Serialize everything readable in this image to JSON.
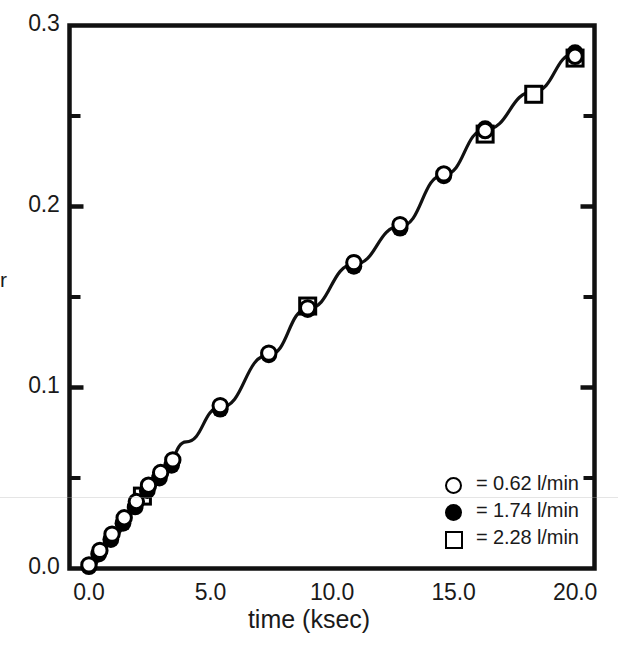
{
  "chart_data": {
    "type": "scatter",
    "title": "",
    "xlabel": "time (ksec)",
    "ylabel": "",
    "xlim": [
      -0.8,
      20.8
    ],
    "ylim": [
      0.0,
      0.3
    ],
    "xticks": [
      0.0,
      5.0,
      10.0,
      15.0,
      20.0
    ],
    "xtick_labels": [
      "0.0",
      "5.0",
      "10.0",
      "15.0",
      "20.0"
    ],
    "yticks": [
      0.0,
      0.1,
      0.2,
      0.3
    ],
    "ytick_labels": [
      "0.0",
      "0.1",
      "0.2",
      "0.3"
    ],
    "yminorticks": [
      0.05,
      0.15,
      0.25
    ],
    "grid": false,
    "legend_position": "lower-right",
    "series": [
      {
        "name": "0.62 l/min",
        "label": "= 0.62 l/min",
        "marker": "open-circle",
        "color": "#000000",
        "points": [
          [
            0.0,
            0.002
          ],
          [
            0.45,
            0.01
          ],
          [
            0.95,
            0.019
          ],
          [
            1.45,
            0.028
          ],
          [
            1.95,
            0.037
          ],
          [
            2.45,
            0.046
          ],
          [
            2.95,
            0.053
          ],
          [
            3.45,
            0.06
          ],
          [
            5.4,
            0.09
          ],
          [
            7.4,
            0.119
          ],
          [
            9.0,
            0.144
          ],
          [
            10.9,
            0.169
          ],
          [
            12.8,
            0.19
          ],
          [
            14.6,
            0.218
          ],
          [
            16.3,
            0.242
          ],
          [
            20.0,
            0.283
          ]
        ]
      },
      {
        "name": "1.74 l/min",
        "label": "= 1.74 l/min",
        "marker": "filled-circle",
        "color": "#000000",
        "points": [
          [
            0.0,
            0.001
          ],
          [
            0.4,
            0.008
          ],
          [
            0.9,
            0.016
          ],
          [
            1.4,
            0.025
          ],
          [
            1.9,
            0.034
          ],
          [
            2.4,
            0.043
          ],
          [
            2.9,
            0.05
          ],
          [
            3.4,
            0.057
          ],
          [
            5.4,
            0.088
          ],
          [
            7.4,
            0.118
          ],
          [
            9.0,
            0.143
          ],
          [
            10.9,
            0.167
          ],
          [
            12.8,
            0.188
          ],
          [
            14.6,
            0.217
          ],
          [
            16.3,
            0.243
          ],
          [
            20.0,
            0.285
          ]
        ]
      },
      {
        "name": "2.28 l/min",
        "label": "= 2.28 l/min",
        "marker": "open-square",
        "color": "#000000",
        "points": [
          [
            2.2,
            0.04
          ],
          [
            9.0,
            0.145
          ],
          [
            16.3,
            0.24
          ],
          [
            18.3,
            0.262
          ],
          [
            20.0,
            0.282
          ]
        ]
      }
    ],
    "fit_curve": {
      "name": "fitted-curve",
      "points": [
        [
          0.0,
          0.0
        ],
        [
          1.0,
          0.018
        ],
        [
          2.0,
          0.036
        ],
        [
          3.0,
          0.053
        ],
        [
          4.0,
          0.07
        ],
        [
          5.4,
          0.089
        ],
        [
          7.4,
          0.118
        ],
        [
          9.0,
          0.1435
        ],
        [
          10.9,
          0.168
        ],
        [
          12.8,
          0.189
        ],
        [
          14.6,
          0.2175
        ],
        [
          16.3,
          0.2425
        ],
        [
          18.3,
          0.2635
        ],
        [
          20.0,
          0.2845
        ]
      ]
    }
  },
  "axis": {
    "y_partial_label": "r",
    "x_title": "time (ksec)"
  },
  "legend": {
    "entries": [
      {
        "marker": "open-circle",
        "text": "=  0.62 l/min"
      },
      {
        "marker": "filled-circle",
        "text": "=  1.74 l/min"
      },
      {
        "marker": "open-square",
        "text": "=  2.28 l/min"
      }
    ]
  }
}
